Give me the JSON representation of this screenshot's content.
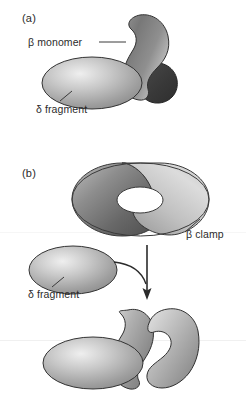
{
  "figure": {
    "background_color": "#ffffff",
    "width": 246,
    "height": 411
  },
  "panels": [
    {
      "id": "a",
      "label": "(a)",
      "callouts": [
        {
          "id": "beta-monomer",
          "label": "β monomer"
        },
        {
          "id": "delta-fragment-a",
          "label": "δ fragment"
        }
      ]
    },
    {
      "id": "b",
      "label": "(b)",
      "callouts": [
        {
          "id": "beta-clamp",
          "label": "β clamp"
        },
        {
          "id": "delta-fragment-b",
          "label": "δ fragment"
        }
      ]
    }
  ],
  "shapes": {
    "beta_monomer": "kidney-lobe",
    "beta_monomer_dark_lobe": "dark-rounded-lobe",
    "delta_fragment": "shaded-ellipse",
    "beta_clamp_closed": "torus-ring",
    "beta_clamp_open": "open-c-clamp",
    "arrow": "down-arrow"
  },
  "colors": {
    "outline": "#2b2b2b",
    "gray_light": "#e2e2e2",
    "gray_mid": "#a8a8a8",
    "gray_dark": "#6e6e6e",
    "gray_darker": "#4f4f4f",
    "lobe_dark": "#3a3a3a",
    "text": "#2b2b2b",
    "background": "#ffffff"
  }
}
